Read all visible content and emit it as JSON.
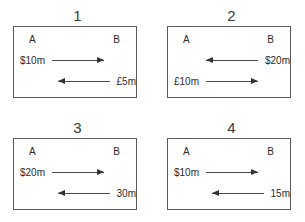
{
  "diagram": {
    "panels": [
      {
        "title": "1",
        "agent_left": "A",
        "agent_right": "B",
        "flows": [
          {
            "label": "$10m",
            "direction": "right",
            "label_side": "left"
          },
          {
            "label": "£5m",
            "direction": "left",
            "label_side": "right"
          }
        ]
      },
      {
        "title": "2",
        "agent_left": "A",
        "agent_right": "B",
        "flows": [
          {
            "label": "$20m",
            "direction": "left",
            "label_side": "right"
          },
          {
            "label": "£10m",
            "direction": "right",
            "label_side": "left"
          }
        ]
      },
      {
        "title": "3",
        "agent_left": "A",
        "agent_right": "B",
        "flows": [
          {
            "label": "$20m",
            "direction": "right",
            "label_side": "left"
          },
          {
            "label": "30m",
            "direction": "left",
            "label_side": "right"
          }
        ]
      },
      {
        "title": "4",
        "agent_left": "A",
        "agent_right": "B",
        "flows": [
          {
            "label": "$10m",
            "direction": "right",
            "label_side": "left"
          },
          {
            "label": "15m",
            "direction": "left",
            "label_side": "right"
          }
        ]
      }
    ],
    "colors": {
      "background": "#ffffff",
      "border": "#595959",
      "text": "#2b2b2b",
      "arrow": "#4a4a4a",
      "arrow_head": "#333333"
    }
  }
}
